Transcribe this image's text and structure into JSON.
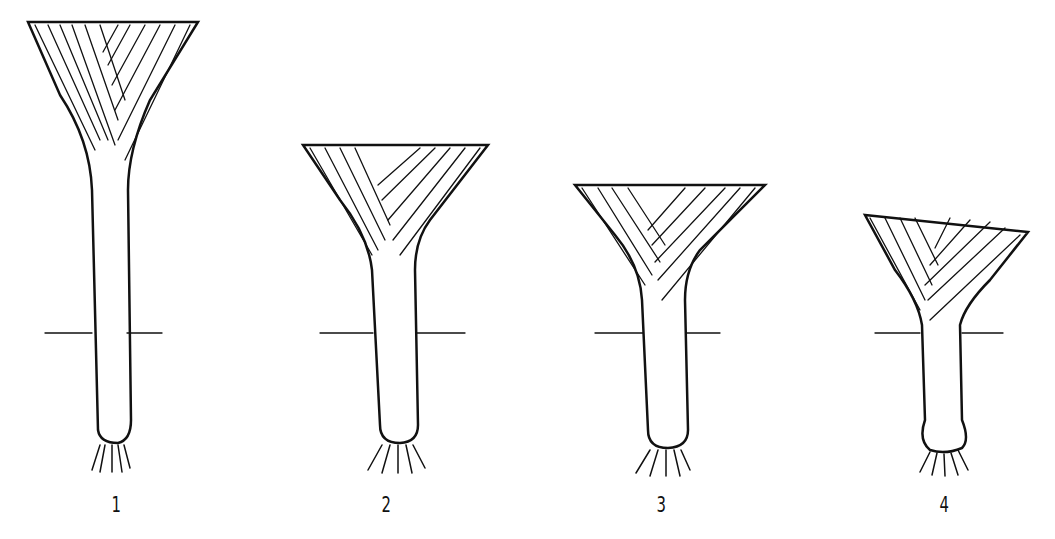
{
  "figure": {
    "labels": [
      "1",
      "2",
      "3",
      "4"
    ],
    "ground_line": true,
    "leeks": [
      {
        "label": "1",
        "form": "long slender shaft, wide fan of leaves"
      },
      {
        "label": "2",
        "form": "medium shaft"
      },
      {
        "label": "3",
        "form": "medium shaft, slightly curved"
      },
      {
        "label": "4",
        "form": "short shaft with bulbous base"
      }
    ]
  }
}
